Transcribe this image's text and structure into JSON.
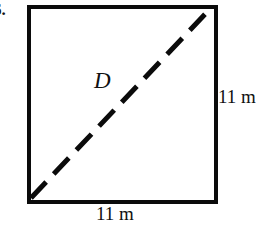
{
  "figure": {
    "problem_number": "6.",
    "shape": "square",
    "stroke_color": "#0b0b0b",
    "background_color": "#ffffff",
    "square": {
      "x": 27,
      "y": 5,
      "width": 183,
      "height": 191,
      "border_width": 4
    },
    "diagonal": {
      "label": "D",
      "style": "dashed",
      "stroke_width": 5,
      "dash_length": 22,
      "dash_gap": 11,
      "from": [
        31,
        198
      ],
      "to": [
        210,
        9
      ]
    },
    "labels": {
      "right_side": "11 m",
      "bottom_side": "11 m"
    }
  }
}
